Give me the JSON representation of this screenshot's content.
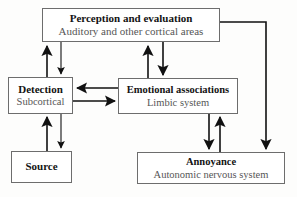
{
  "diagram": {
    "background_color": "#fdfdfc",
    "node_border_color": "#6d6d6d",
    "connector_color": "#111111",
    "title_color": "#131313",
    "subtitle_color": "#565656",
    "nodes": [
      {
        "id": "perception",
        "title": "Perception and evaluation",
        "subtitle": "Auditory and other cortical areas"
      },
      {
        "id": "detection",
        "title": "Detection",
        "subtitle": "Subcortical"
      },
      {
        "id": "emotional",
        "title": "Emotional associations",
        "subtitle": "Limbic system"
      },
      {
        "id": "source",
        "title": "Source",
        "subtitle": ""
      },
      {
        "id": "annoyance",
        "title": "Annoyance",
        "subtitle": "Autonomic nervous system"
      }
    ],
    "connectors": [
      {
        "id": "detection-to-perception",
        "from": "detection",
        "to": "perception",
        "direction": "up"
      },
      {
        "id": "perception-to-detection",
        "from": "perception",
        "to": "detection",
        "direction": "down"
      },
      {
        "id": "emotional-to-perception",
        "from": "emotional",
        "to": "perception",
        "direction": "up"
      },
      {
        "id": "perception-to-emotional",
        "from": "perception",
        "to": "emotional",
        "direction": "down"
      },
      {
        "id": "emotional-to-detection",
        "from": "emotional",
        "to": "detection",
        "direction": "left"
      },
      {
        "id": "detection-to-emotional",
        "from": "detection",
        "to": "emotional",
        "direction": "right"
      },
      {
        "id": "source-to-detection",
        "from": "source",
        "to": "detection",
        "direction": "up"
      },
      {
        "id": "detection-to-source",
        "from": "detection",
        "to": "source",
        "direction": "down"
      },
      {
        "id": "emotional-to-annoyance",
        "from": "emotional",
        "to": "annoyance",
        "direction": "down"
      },
      {
        "id": "annoyance-to-emotional",
        "from": "annoyance",
        "to": "emotional",
        "direction": "up"
      },
      {
        "id": "perception-to-annoyance",
        "from": "perception",
        "to": "annoyance",
        "direction": "down-right-elbow"
      }
    ]
  }
}
